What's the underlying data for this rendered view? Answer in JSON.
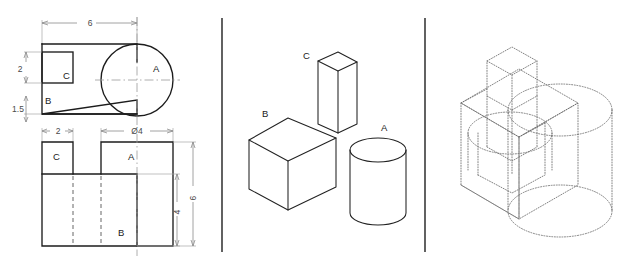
{
  "figure": {
    "background_color": "#ffffff",
    "line_color": "#1c1c1c",
    "dim_color": "#8c8c8c",
    "hidden_color": "#555555",
    "panels": [
      {
        "id": "panel-orthographic",
        "name": "orthographic-views"
      },
      {
        "id": "panel-primitives",
        "name": "isometric-primitives"
      },
      {
        "id": "panel-assembly",
        "name": "wireframe-assembly"
      }
    ]
  },
  "panel_left": {
    "name": "orthographic-views",
    "top_view": {
      "name": "top-view",
      "labels": {
        "part_a": "A",
        "part_b": "B",
        "part_c": "C"
      },
      "dimensions": {
        "width_overall": "6",
        "height_upper": "2",
        "height_lower": "1.5"
      }
    },
    "front_view": {
      "name": "front-view",
      "labels": {
        "part_a": "A",
        "part_b": "B",
        "part_c": "C"
      },
      "dimensions": {
        "width_c": "2",
        "diameter_a": "Ø4",
        "height_overall": "6",
        "height_inner": "4"
      }
    }
  },
  "panel_middle": {
    "name": "isometric-primitives",
    "shapes": [
      {
        "id": "cylinder-a",
        "label": "A",
        "kind": "cylinder"
      },
      {
        "id": "box-b",
        "label": "B",
        "kind": "rectangular-prism"
      },
      {
        "id": "prism-c",
        "label": "C",
        "kind": "tall-square-prism"
      }
    ]
  },
  "panel_right": {
    "name": "wireframe-assembly",
    "description": "dotted isometric wireframe of combined solid",
    "style": "dotted"
  }
}
